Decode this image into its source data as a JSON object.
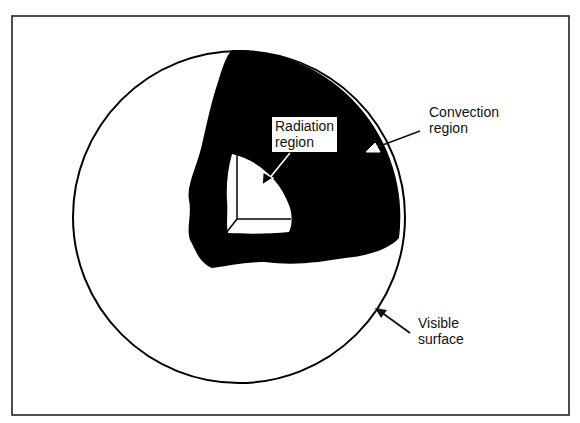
{
  "figure": {
    "type": "schematic diagram",
    "frame_color": "#222222",
    "fill_color": "#000000",
    "background": "#ffffff"
  },
  "labels": {
    "radiation": [
      "Radiation",
      "region"
    ],
    "convection": [
      "Convection",
      "region"
    ],
    "visible": [
      "Visible",
      "surface"
    ]
  },
  "caption": {
    "text": ""
  }
}
